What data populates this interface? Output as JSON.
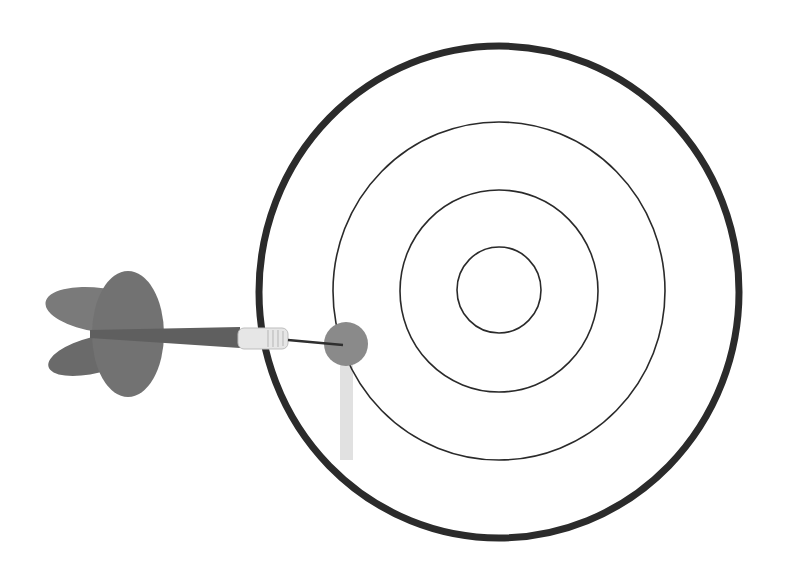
{
  "scene": {
    "description": "Dart hitting outer ring of a target",
    "colors": {
      "background": "#ffffff",
      "outer_ring": "#2b2b2b",
      "inner_rings": "#2a2a2a",
      "dart_body": "#6e6e6e",
      "dart_barrel": "#e4e4e4",
      "hit_marker": "#8a8a8a",
      "drip": "#d6d6d6"
    },
    "target": {
      "center": [
        499,
        291
      ],
      "rings": [
        {
          "rx": 240,
          "ry": 246,
          "stroke": 7
        },
        {
          "rx": 166,
          "ry": 169,
          "stroke": 1.6
        },
        {
          "rx": 99,
          "ry": 101,
          "stroke": 1.6
        },
        {
          "rx": 42,
          "ry": 43,
          "stroke": 1.6
        }
      ]
    },
    "hit": {
      "cx": 346,
      "cy": 344,
      "r": 22
    }
  }
}
